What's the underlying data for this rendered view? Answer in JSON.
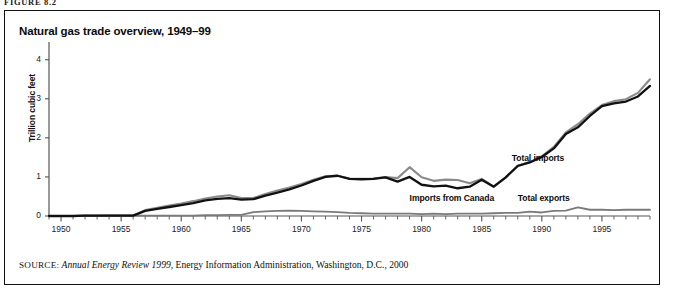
{
  "figure": {
    "label": "FIGURE 8.2"
  },
  "panel": {
    "title": "Natural gas trade overview, 1949–99",
    "source_prefix": "SOURCE:",
    "source_italic": "Annual Energy Review 1999",
    "source_rest": ", Energy Information Administration, Washington, D.C., 2000"
  },
  "annotations": {
    "total_imports": "Total imports",
    "imports_from_canada": "Imports from Canada",
    "total_exports": "Total exports"
  },
  "colors": {
    "total_imports": "#8a8a8a",
    "imports_from_canada": "#111111",
    "total_exports": "#7a7a7a",
    "axis": "#555555",
    "frame": "#111111"
  },
  "chart_data": {
    "type": "line",
    "title": "Natural gas trade overview, 1949–99",
    "xlabel": "",
    "ylabel": "Trillion cubic feet",
    "xlim": [
      1949,
      1999
    ],
    "ylim": [
      0,
      4.3
    ],
    "yticks": [
      0,
      1,
      2,
      3,
      4
    ],
    "ytick_labels": [
      "0",
      "1",
      "2",
      "3",
      "4"
    ],
    "xticks": [
      1950,
      1955,
      1960,
      1965,
      1970,
      1975,
      1980,
      1985,
      1990,
      1995
    ],
    "xtick_labels": [
      "1950",
      "1955",
      "1960",
      "1965",
      "1970",
      "1975",
      "1980",
      "1985",
      "1990",
      "1995"
    ],
    "minor_xtick_interval": 1,
    "grid": false,
    "legend": "inline annotations",
    "x": [
      1949,
      1950,
      1951,
      1952,
      1953,
      1954,
      1955,
      1956,
      1957,
      1958,
      1959,
      1960,
      1961,
      1962,
      1963,
      1964,
      1965,
      1966,
      1967,
      1968,
      1969,
      1970,
      1971,
      1972,
      1973,
      1974,
      1975,
      1976,
      1977,
      1978,
      1979,
      1980,
      1981,
      1982,
      1983,
      1984,
      1985,
      1986,
      1987,
      1988,
      1989,
      1990,
      1991,
      1992,
      1993,
      1994,
      1995,
      1996,
      1997,
      1998,
      1999
    ],
    "series": [
      {
        "name": "Total imports",
        "color": "#8a8a8a",
        "values": [
          0.0,
          0.0,
          0.0,
          0.01,
          0.01,
          0.01,
          0.01,
          0.01,
          0.15,
          0.21,
          0.27,
          0.32,
          0.38,
          0.45,
          0.5,
          0.53,
          0.46,
          0.46,
          0.56,
          0.65,
          0.73,
          0.82,
          0.93,
          1.02,
          1.03,
          0.96,
          0.95,
          0.96,
          1.0,
          0.97,
          1.25,
          0.99,
          0.9,
          0.93,
          0.92,
          0.84,
          0.95,
          0.75,
          0.99,
          1.29,
          1.38,
          1.53,
          1.77,
          2.14,
          2.35,
          2.62,
          2.84,
          2.94,
          2.99,
          3.15,
          3.5
        ],
        "linewidth": 2.1
      },
      {
        "name": "Imports from Canada",
        "color": "#111111",
        "values": [
          0.0,
          0.0,
          0.0,
          0.01,
          0.01,
          0.01,
          0.01,
          0.01,
          0.13,
          0.18,
          0.23,
          0.28,
          0.33,
          0.4,
          0.44,
          0.46,
          0.42,
          0.43,
          0.52,
          0.6,
          0.68,
          0.78,
          0.9,
          1.0,
          1.03,
          0.95,
          0.94,
          0.95,
          0.99,
          0.88,
          1.0,
          0.8,
          0.76,
          0.78,
          0.71,
          0.75,
          0.93,
          0.75,
          0.99,
          1.28,
          1.37,
          1.51,
          1.73,
          2.1,
          2.27,
          2.56,
          2.81,
          2.88,
          2.93,
          3.06,
          3.33
        ],
        "linewidth": 2.3
      },
      {
        "name": "Total exports",
        "color": "#7a7a7a",
        "values": [
          0.0,
          0.0,
          0.0,
          0.0,
          0.0,
          0.01,
          0.01,
          0.01,
          0.01,
          0.01,
          0.01,
          0.01,
          0.01,
          0.02,
          0.02,
          0.03,
          0.03,
          0.1,
          0.12,
          0.13,
          0.14,
          0.13,
          0.12,
          0.11,
          0.1,
          0.08,
          0.07,
          0.06,
          0.06,
          0.06,
          0.06,
          0.05,
          0.06,
          0.05,
          0.06,
          0.06,
          0.06,
          0.07,
          0.08,
          0.08,
          0.11,
          0.09,
          0.13,
          0.14,
          0.22,
          0.16,
          0.16,
          0.15,
          0.16,
          0.16,
          0.16
        ],
        "linewidth": 1.8
      }
    ],
    "annotations": [
      {
        "text": "Total imports",
        "x": 1987.5,
        "y": 1.45
      },
      {
        "text": "Imports from Canada",
        "x": 1979.0,
        "y": 0.43
      },
      {
        "text": "Total exports",
        "x": 1988.0,
        "y": 0.43
      }
    ]
  }
}
